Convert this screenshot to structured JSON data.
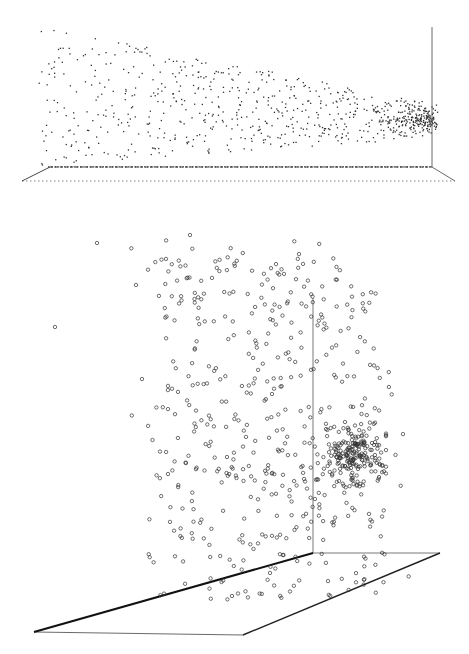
{
  "chart_data": [
    {
      "type": "scatter",
      "title": "",
      "subtitle": "",
      "xlabel": "",
      "ylabel": "",
      "zlabel": "",
      "projection": "3d",
      "marker": "dot",
      "marker_color": "#333333",
      "grid": false,
      "legend": null,
      "tick_labels": [],
      "description": "3D point cloud viewed from the side: widely scattered points on the left converging to a dense cluster at the right near the vertical axis",
      "frame": {
        "vertical_axis": [
          [
            432,
            27
          ],
          [
            432,
            167
          ]
        ],
        "floor": [
          [
            50,
            167
          ],
          [
            432,
            167
          ],
          [
            455,
            181
          ],
          [
            22,
            181
          ]
        ],
        "floor_style": "dotted"
      },
      "generator": {
        "seed": 7,
        "spread_count": 620,
        "cluster_count": 180,
        "cluster_center": [
          425,
          120
        ],
        "cluster_sd": [
          14,
          6
        ]
      }
    },
    {
      "type": "scatter",
      "title": "",
      "subtitle": "",
      "xlabel": "",
      "ylabel": "",
      "zlabel": "",
      "projection": "3d",
      "marker": "circle-open",
      "marker_color": "#333333",
      "grid": false,
      "legend": null,
      "tick_labels": [],
      "description": "Same 3D point cloud rotated: diffuse cloud on the left, dense cluster to the right of the vertical axis",
      "frame": {
        "vertical_axis": [
          [
            313,
            78
          ],
          [
            313,
            333
          ]
        ],
        "floor": [
          [
            313,
            333
          ],
          [
            440,
            333
          ],
          [
            243,
            415
          ],
          [
            34,
            412
          ]
        ],
        "floor_thick_edge": [
          [
            34,
            412
          ],
          [
            313,
            333
          ]
        ]
      },
      "generator": {
        "seed": 13,
        "spread_count": 520,
        "cluster_count": 200,
        "cluster_center": [
          357,
          235
        ],
        "cluster_sd": [
          16,
          14
        ]
      }
    }
  ]
}
